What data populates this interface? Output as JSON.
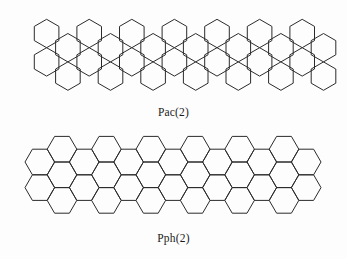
{
  "page": {
    "background_color": "#fdfdfd",
    "stroke_color": "#2b2b2b",
    "text_color": "#1a1a1a"
  },
  "figures": [
    {
      "id": "pac",
      "caption": "Pac(2)",
      "structure_type": "hexagonal-lattice-diagram",
      "description": "linear polyacene-like catacondensed double row of pointy-top hexagons",
      "hex_orientation": "pointy-top",
      "rows": 2,
      "hexagons_top_row": 7,
      "hexagons_bottom_row": 7,
      "geometry": {
        "hex_radius": 14.2,
        "row_top_center_y": 33.5,
        "row_bottom_center_y": 69.1,
        "top_row_start_x": 46.6,
        "bottom_row_start_x": 34.3,
        "column_step_x": 42.6
      }
    },
    {
      "id": "pph",
      "caption": "Pph(2)",
      "structure_type": "hexagonal-lattice-diagram",
      "description": "staircase chain of flat-top hexagons in repeating stacked-pair units",
      "hex_orientation": "flat-top",
      "units": 4,
      "hexagons_total": 16,
      "geometry": {
        "hex_radius": 14.8,
        "unit_step_x": 74.0,
        "stack_center_y_upper": 34.0,
        "stack_center_y_lower": 64.6,
        "offset_center_y_upper": 18.6,
        "offset_center_y_lower": 49.3
      }
    }
  ]
}
